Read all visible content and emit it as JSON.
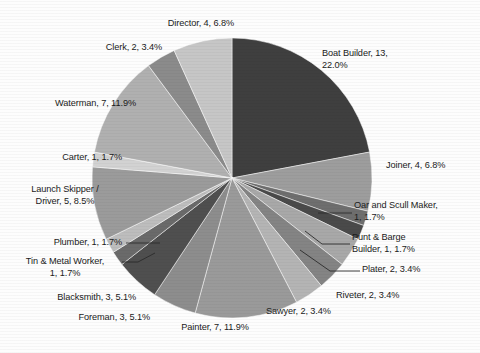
{
  "chart_data": {
    "type": "pie",
    "title": "",
    "subtitle": "",
    "xlabel": "",
    "ylabel": "",
    "legend_position": "none",
    "grid": false,
    "total": 59,
    "label_format": "name, count, percent",
    "start_angle_deg": 0,
    "direction": "clockwise",
    "categories": [
      "Boat Builder",
      "Joiner",
      "Oar and Scull Maker",
      "Punt & Barge Builder",
      "Plater",
      "Riveter",
      "Sawyer",
      "Painter",
      "Foreman",
      "Blacksmith",
      "Tin & Metal Worker",
      "Plumber",
      "Launch Skipper / Driver",
      "Carter",
      "Waterman",
      "Clerk",
      "Director"
    ],
    "values": [
      13,
      4,
      1,
      1,
      2,
      2,
      2,
      7,
      3,
      3,
      1,
      1,
      5,
      1,
      7,
      2,
      4
    ],
    "percents": [
      22.0,
      6.8,
      1.7,
      1.7,
      3.4,
      3.4,
      3.4,
      11.9,
      5.1,
      5.1,
      1.7,
      1.7,
      8.5,
      1.7,
      11.9,
      3.4,
      6.8
    ],
    "colors": [
      "#3f3f3f",
      "#9d9d9d",
      "#6e6e6e",
      "#4a4a4a",
      "#a8a8a8",
      "#848484",
      "#b4b4b4",
      "#9a9a9a",
      "#8d8d8d",
      "#4f4f4f",
      "#6a6a6a",
      "#bdbdbd",
      "#9b9b9b",
      "#d2d2d2",
      "#b0b0b0",
      "#8b8b8b",
      "#c6c6c6"
    ],
    "labels": [
      "Boat Builder, 13, 22.0%",
      "Joiner, 4, 6.8%",
      "Oar and Scull Maker, 1, 1.7%",
      "Punt & Barge Builder, 1, 1.7%",
      "Plater, 2, 3.4%",
      "Riveter, 2, 3.4%",
      "Sawyer, 2, 3.4%",
      "Painter, 7, 11.9%",
      "Foreman, 3, 5.1%",
      "Blacksmith, 3, 5.1%",
      "Tin & Metal Worker, 1, 1.7%",
      "Plumber, 1, 1.7%",
      "Launch Skipper / Driver, 5, 8.5%",
      "Carter, 1, 1.7%",
      "Waterman, 7, 11.9%",
      "Clerk, 2, 3.4%",
      "Director, 4, 6.8%"
    ]
  },
  "label_text": {
    "boat_builder": "Boat Builder, 13,\n22.0%",
    "joiner": "Joiner, 4, 6.8%",
    "oar_and_scull_maker": "Oar and Scull Maker,\n1, 1.7%",
    "punt_and_barge_builder": "Punt & Barge\nBuilder, 1, 1.7%",
    "plater": "Plater, 2, 3.4%",
    "riveter": "Riveter, 2, 3.4%",
    "sawyer": "Sawyer, 2, 3.4%",
    "painter": "Painter, 7, 11.9%",
    "foreman": "Foreman, 3, 5.1%",
    "blacksmith": "Blacksmith, 3, 5.1%",
    "tin_and_metal_worker": "Tin & Metal Worker,\n1, 1.7%",
    "plumber": "Plumber, 1, 1.7%",
    "launch_skipper_driver": "Launch Skipper /\nDriver, 5, 8.5%",
    "carter": "Carter, 1, 1.7%",
    "waterman": "Waterman, 7, 11.9%",
    "clerk": "Clerk, 2, 3.4%",
    "director": "Director, 4, 6.8%"
  }
}
